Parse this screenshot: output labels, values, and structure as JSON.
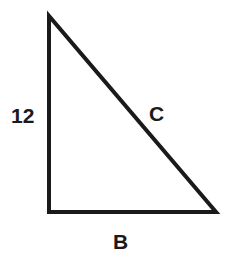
{
  "figure": {
    "type": "right-triangle-diagram",
    "background_color": "#ffffff",
    "stroke_color": "#1a1a1a",
    "stroke_width": 4,
    "labels": {
      "vertical_leg": "12",
      "hypotenuse": "C",
      "base": "B"
    },
    "geometry": {
      "apex": [
        49,
        16
      ],
      "bottom_left": [
        49,
        212
      ],
      "bottom_right": [
        216,
        212
      ]
    }
  }
}
